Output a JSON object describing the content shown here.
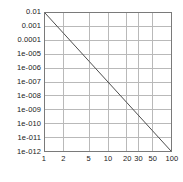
{
  "chart_data": {
    "type": "line",
    "title": "",
    "subtitle": "",
    "xlabel": "",
    "ylabel": "",
    "xscale": "log",
    "yscale": "log",
    "xlim": [
      1,
      100
    ],
    "ylim": [
      1e-12,
      0.01
    ],
    "grid": true,
    "legend": null,
    "legend_position": "none",
    "x_tick_labels": [
      "1",
      "2",
      "5",
      "10",
      "20",
      "30",
      "50",
      "100"
    ],
    "x_tick_values": [
      1,
      2,
      5,
      10,
      20,
      30,
      50,
      100
    ],
    "y_tick_labels": [
      "0.01",
      "0.001",
      "0.0001",
      "1e-005",
      "1e-006",
      "1e-007",
      "1e-008",
      "1e-009",
      "1e-010",
      "1e-011",
      "1e-012"
    ],
    "y_tick_values": [
      0.01,
      0.001,
      0.0001,
      1e-05,
      1e-06,
      1e-07,
      1e-08,
      1e-09,
      1e-10,
      1e-11,
      1e-12
    ],
    "series": [
      {
        "name": "",
        "x": [
          1,
          2,
          5,
          10,
          20,
          30,
          50,
          100
        ],
        "y": [
          0.01,
          0.0003125,
          3.2e-06,
          1e-07,
          3.125e-09,
          4.1152e-10,
          3.2e-11,
          1e-12
        ],
        "color": "#4a4a4a"
      }
    ],
    "annotations": [],
    "colors": {
      "axis": "#7a7a7a",
      "grid": "#b8b8b8",
      "line": "#4a4a4a",
      "text": "#1a1a1a",
      "background": "#ffffff"
    }
  }
}
